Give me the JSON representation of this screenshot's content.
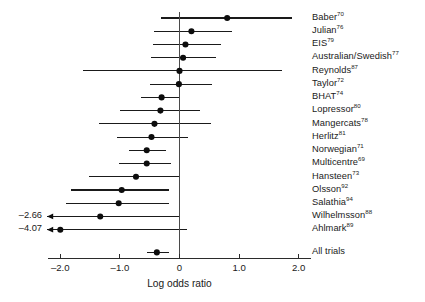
{
  "chart_data": {
    "type": "scatter",
    "subtype": "forest-plot",
    "title": "",
    "xlabel": "Log odds ratio",
    "ylabel": "",
    "xlim": [
      -2.2,
      2.05
    ],
    "xticks": [
      -2.0,
      -1.0,
      0,
      1.0,
      2.0
    ],
    "xtick_labels": [
      "–2.0",
      "–1.0",
      "0",
      "1.0",
      "2.0"
    ],
    "grid": false,
    "legend": false,
    "reference_line": 0,
    "categories": [
      "Baber70",
      "Julian76",
      "EIS79",
      "Australian/Swedish77",
      "Reynolds87",
      "Taylor72",
      "BHAT74",
      "Lopressor80",
      "Mangercats78",
      "Herlitz81",
      "Norwegian71",
      "Multicentre69",
      "Hansteen73",
      "Olsson92",
      "Salathia94",
      "Wilhelmsson88",
      "Ahlmark89",
      "All trials"
    ],
    "series": [
      {
        "name": "Log odds ratio (point estimate and 95% CI)",
        "points": [
          {
            "label": "Baber",
            "ref": "70",
            "value": 0.8,
            "ci_low": -0.31,
            "ci_high": 1.88,
            "truncated_low": false,
            "truncated_label": ""
          },
          {
            "label": "Julian",
            "ref": "76",
            "value": 0.2,
            "ci_low": -0.42,
            "ci_high": 0.88,
            "truncated_low": false,
            "truncated_label": ""
          },
          {
            "label": "EIS",
            "ref": "79",
            "value": 0.1,
            "ci_low": -0.45,
            "ci_high": 0.7,
            "truncated_low": false,
            "truncated_label": ""
          },
          {
            "label": "Australian/Swedish",
            "ref": "77",
            "value": 0.06,
            "ci_low": -0.48,
            "ci_high": 0.62,
            "truncated_low": false,
            "truncated_label": ""
          },
          {
            "label": "Reynolds",
            "ref": "87",
            "value": 0.0,
            "ci_low": -1.62,
            "ci_high": 1.72,
            "truncated_low": false,
            "truncated_label": ""
          },
          {
            "label": "Taylor",
            "ref": "72",
            "value": -0.01,
            "ci_low": -0.5,
            "ci_high": 0.55,
            "truncated_low": false,
            "truncated_label": ""
          },
          {
            "label": "BHAT",
            "ref": "74",
            "value": -0.3,
            "ci_low": -0.65,
            "ci_high": 0.0,
            "truncated_low": false,
            "truncated_label": ""
          },
          {
            "label": "Lopressor",
            "ref": "80",
            "value": -0.32,
            "ci_low": -1.0,
            "ci_high": 0.35,
            "truncated_low": false,
            "truncated_label": ""
          },
          {
            "label": "Mangercats",
            "ref": "78",
            "value": -0.42,
            "ci_low": -1.35,
            "ci_high": 0.53,
            "truncated_low": false,
            "truncated_label": ""
          },
          {
            "label": "Herlitz",
            "ref": "81",
            "value": -0.47,
            "ci_low": -1.05,
            "ci_high": 0.15,
            "truncated_low": false,
            "truncated_label": ""
          },
          {
            "label": "Norwegian",
            "ref": "71",
            "value": -0.55,
            "ci_low": -0.85,
            "ci_high": -0.22,
            "truncated_low": false,
            "truncated_label": ""
          },
          {
            "label": "Multicentre",
            "ref": "69",
            "value": -0.55,
            "ci_low": -1.02,
            "ci_high": -0.15,
            "truncated_low": false,
            "truncated_label": ""
          },
          {
            "label": "Hansteen",
            "ref": "73",
            "value": -0.73,
            "ci_low": -1.52,
            "ci_high": 0.0,
            "truncated_low": false,
            "truncated_label": ""
          },
          {
            "label": "Olsson",
            "ref": "92",
            "value": -0.97,
            "ci_low": -1.82,
            "ci_high": -0.17,
            "truncated_low": false,
            "truncated_label": ""
          },
          {
            "label": "Salathia",
            "ref": "94",
            "value": -1.02,
            "ci_low": -1.9,
            "ci_high": -0.17,
            "truncated_low": false,
            "truncated_label": ""
          },
          {
            "label": "Wilhelmsson",
            "ref": "88",
            "value": -1.33,
            "ci_low": -2.66,
            "ci_high": 0.0,
            "truncated_low": true,
            "truncated_label": "–2.66"
          },
          {
            "label": "Ahlmark",
            "ref": "89",
            "value": -2.0,
            "ci_low": -4.07,
            "ci_high": 0.13,
            "truncated_low": true,
            "truncated_label": "–4.07"
          },
          {
            "label": "All trials",
            "ref": "",
            "value": -0.38,
            "ci_low": -0.55,
            "ci_high": -0.18,
            "truncated_low": false,
            "truncated_label": ""
          }
        ]
      }
    ],
    "colors": {
      "marker": "#0d0d0d",
      "ci": "#1a1a1a",
      "zero_line": "#4a4a4a",
      "axis": "#2b2b2b",
      "background": "#ffffff"
    }
  }
}
